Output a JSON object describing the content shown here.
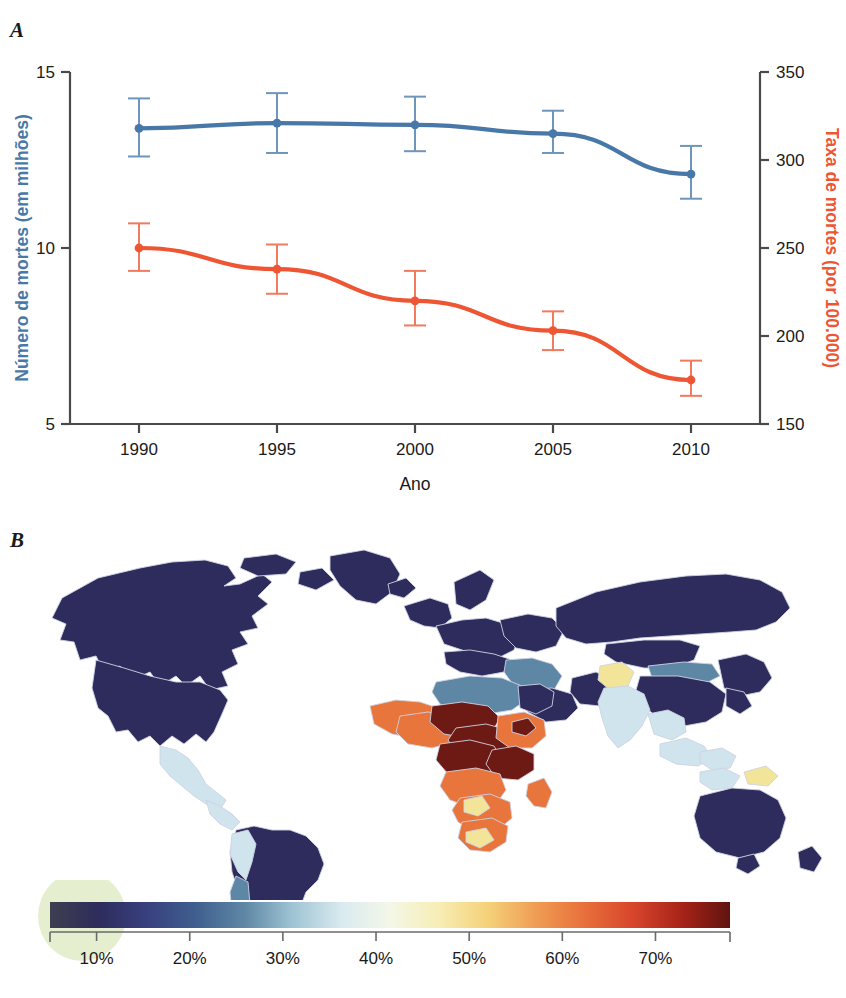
{
  "figure": {
    "panel_a_label": "A",
    "panel_b_label": "B"
  },
  "chart_data": [
    {
      "type": "line",
      "title": "",
      "xlabel": "Ano",
      "ylabel": "Número de mortes (em milhões)",
      "y2label": "Taxa de mortes (por 100.000)",
      "x": [
        1990,
        1995,
        2000,
        2005,
        2010
      ],
      "xtick_labels": [
        "1990",
        "1995",
        "2000",
        "2005",
        "2010"
      ],
      "xlim": [
        1987.5,
        2012.5
      ],
      "ylim": [
        5,
        15
      ],
      "ytick_labels": [
        "5",
        "10",
        "15"
      ],
      "yticks": [
        5,
        10,
        15
      ],
      "y2lim": [
        150,
        350
      ],
      "y2tick_labels": [
        "150",
        "200",
        "250",
        "300",
        "350"
      ],
      "y2ticks": [
        150,
        200,
        250,
        300,
        350
      ],
      "grid": false,
      "legend": "none",
      "series": [
        {
          "name": "Número de mortes (em milhões)",
          "axis": "left",
          "color": "#4878a8",
          "values": [
            13.4,
            13.55,
            13.5,
            13.25,
            12.1
          ],
          "err_low": [
            12.6,
            12.7,
            12.75,
            12.7,
            11.4
          ],
          "err_high": [
            14.25,
            14.4,
            14.3,
            13.9,
            12.9
          ]
        },
        {
          "name": "Taxa de mortes (por 100.000)",
          "axis": "right",
          "color": "#ee5533",
          "values": [
            250,
            238,
            220,
            203,
            175
          ],
          "err_low": [
            237,
            224,
            206,
            192,
            166
          ],
          "err_high": [
            264,
            252,
            237,
            214,
            186
          ]
        }
      ]
    },
    {
      "type": "heatmap",
      "subtype": "choropleth-world-map",
      "title": "",
      "colorbar": {
        "tick_labels": [
          "10%",
          "20%",
          "30%",
          "40%",
          "50%",
          "60%",
          "70%"
        ],
        "ticks": [
          10,
          20,
          30,
          40,
          50,
          60,
          70
        ],
        "range": [
          5,
          78
        ],
        "gradient_stops": [
          "#3d3f4f",
          "#2e2c5c",
          "#38407f",
          "#3f5f8e",
          "#5e87a5",
          "#9fc4d4",
          "#d9eaef",
          "#f4f7e8",
          "#f7edb4",
          "#f5d27a",
          "#ef9d54",
          "#e8703c",
          "#d8452c",
          "#a82318",
          "#5f1410"
        ]
      }
    }
  ],
  "colors": {
    "blue_series": "#4878a8",
    "red_series": "#ee5533",
    "axis": "#4a4a4a",
    "map_dark_navy": "#2e2c5c",
    "map_steel_blue": "#5e87a5",
    "map_pale_blue": "#cfe4ec",
    "map_cream": "#f3f4e2",
    "map_yellow": "#f2e59a",
    "map_orange": "#e8763c",
    "map_dark_red": "#6d1a14",
    "green_smudge": "#cfe2a8"
  },
  "map": {
    "regions": [
      {
        "name": "north-america",
        "color": "#2e2c5c"
      },
      {
        "name": "greenland",
        "color": "#2e2c5c"
      },
      {
        "name": "central-america",
        "color": "#b9d8e4"
      },
      {
        "name": "caribbean",
        "color": "#cfe4ec"
      },
      {
        "name": "south-america",
        "color": "#2e2c5c"
      },
      {
        "name": "andes",
        "color": "#9cc6d8"
      },
      {
        "name": "europe",
        "color": "#2e2c5c"
      },
      {
        "name": "north-africa",
        "color": "#5e87a5"
      },
      {
        "name": "west-africa",
        "color": "#e8763c"
      },
      {
        "name": "central-africa",
        "color": "#6d1a14"
      },
      {
        "name": "east-africa",
        "color": "#b5361f"
      },
      {
        "name": "southern-africa",
        "color": "#e8763c"
      },
      {
        "name": "madagascar",
        "color": "#e8763c"
      },
      {
        "name": "middle-east",
        "color": "#7ea3bb"
      },
      {
        "name": "india",
        "color": "#cfe4ec"
      },
      {
        "name": "afghanistan",
        "color": "#f2e59a"
      },
      {
        "name": "russia",
        "color": "#2e2c5c"
      },
      {
        "name": "china",
        "color": "#2e2c5c"
      },
      {
        "name": "mongolia",
        "color": "#5e87a5"
      },
      {
        "name": "southeast-asia",
        "color": "#dcecf2"
      },
      {
        "name": "australia",
        "color": "#2e2c5c"
      },
      {
        "name": "new-guinea",
        "color": "#f2e59a"
      }
    ]
  }
}
